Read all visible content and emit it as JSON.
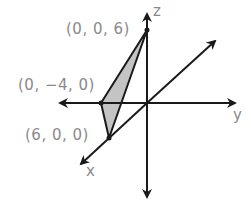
{
  "diagram": {
    "type": "3d-coordinate-axes-with-triangle",
    "colors": {
      "axis": "#1a1a1a",
      "label": "#8a8a8a",
      "fill": "#c4c4c4",
      "background": "#ffffff"
    },
    "axes": {
      "x_label": "x",
      "y_label": "y",
      "z_label": "z"
    },
    "points": [
      {
        "id": "z-intercept",
        "label": "(0, 0, 6)"
      },
      {
        "id": "y-intercept",
        "label": "(0, −4, 0)"
      },
      {
        "id": "x-intercept",
        "label": "(6, 0, 0)"
      }
    ],
    "shaded_region": "triangle connecting (0, 0, 6), (0, −4, 0), (6, 0, 0)"
  }
}
